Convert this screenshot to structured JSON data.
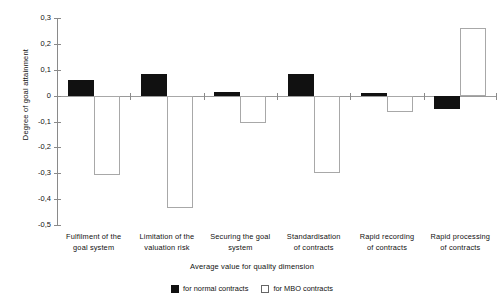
{
  "chart_data": {
    "type": "bar",
    "title": "",
    "xlabel": "Average value for quality dimension",
    "ylabel": "Degree of goal attainment",
    "categories": [
      "Fulfilment of the goal system",
      "Limitation of the valuation risk",
      "Securing the goal system",
      "Standardisation of contracts",
      "Rapid recording of contracts",
      "Rapid processing of contracts"
    ],
    "category_lines": [
      [
        "Fulfilment of the",
        "goal system"
      ],
      [
        "Limitation of the",
        "valuation risk"
      ],
      [
        "Securing the goal",
        "system"
      ],
      [
        "Standardisation",
        "of contracts"
      ],
      [
        "Rapid recording",
        "of contracts"
      ],
      [
        "Rapid processing",
        "of contracts"
      ]
    ],
    "series": [
      {
        "name": "for normal contracts",
        "color": "#111111",
        "values": [
          0.06,
          0.085,
          0.015,
          0.085,
          0.01,
          -0.05
        ]
      },
      {
        "name": "for MBO contracts",
        "color": "#ffffff",
        "values": [
          -0.305,
          -0.435,
          -0.105,
          -0.3,
          -0.065,
          0.26
        ]
      }
    ],
    "ylim": [
      -0.5,
      0.3
    ],
    "ytick_labels": [
      "0,3",
      "0,2",
      "0,1",
      "0",
      "-0,1",
      "-0,2",
      "-0,3",
      "-0,4",
      "-0,5"
    ],
    "ytick_values": [
      0.3,
      0.2,
      0.1,
      0,
      -0.1,
      -0.2,
      -0.3,
      -0.4,
      -0.5
    ],
    "grid": false,
    "legend_position": "bottom"
  },
  "legend": {
    "normal_label": "for normal contracts",
    "mbo_label": "for MBO contracts"
  }
}
